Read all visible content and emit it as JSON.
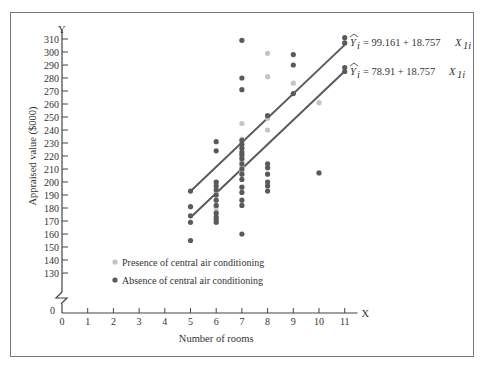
{
  "chart_data": {
    "type": "scatter",
    "title": "",
    "xlabel": "Number of rooms",
    "ylabel": "Appraised value ($000)",
    "x_axis_letter": "X",
    "y_axis_letter": "Y",
    "xlim": [
      0,
      11
    ],
    "ylim": [
      130,
      310
    ],
    "y_axis_break": true,
    "y_origin_label": "0",
    "x_ticks": [
      0,
      1,
      2,
      3,
      4,
      5,
      6,
      7,
      8,
      9,
      10,
      11
    ],
    "y_ticks": [
      130,
      140,
      150,
      160,
      170,
      180,
      190,
      200,
      210,
      220,
      230,
      240,
      250,
      260,
      270,
      280,
      290,
      300,
      310
    ],
    "grid": false,
    "legend_position": "lower-left",
    "series": [
      {
        "name": "Presence of central air conditioning",
        "color": "#c4c4c4",
        "points": [
          [
            6,
            200
          ],
          [
            6,
            192
          ],
          [
            6,
            181
          ],
          [
            6,
            178
          ],
          [
            7,
            245
          ],
          [
            7,
            233
          ],
          [
            7,
            220
          ],
          [
            7,
            216
          ],
          [
            7,
            212
          ],
          [
            7,
            208
          ],
          [
            8,
            299
          ],
          [
            8,
            281
          ],
          [
            8,
            249
          ],
          [
            8,
            240
          ],
          [
            9,
            276
          ],
          [
            10,
            261
          ]
        ]
      },
      {
        "name": "Absence of central air conditioning",
        "color": "#5a5a5a",
        "points": [
          [
            5,
            193
          ],
          [
            5,
            181
          ],
          [
            5,
            174
          ],
          [
            5,
            169
          ],
          [
            5,
            155
          ],
          [
            6,
            231
          ],
          [
            6,
            224
          ],
          [
            6,
            200
          ],
          [
            6,
            197
          ],
          [
            6,
            194
          ],
          [
            6,
            190
          ],
          [
            6,
            186
          ],
          [
            6,
            182
          ],
          [
            6,
            176
          ],
          [
            6,
            173
          ],
          [
            6,
            171
          ],
          [
            6,
            169
          ],
          [
            7,
            309
          ],
          [
            7,
            280
          ],
          [
            7,
            271
          ],
          [
            7,
            232
          ],
          [
            7,
            229
          ],
          [
            7,
            226
          ],
          [
            7,
            223
          ],
          [
            7,
            221
          ],
          [
            7,
            218
          ],
          [
            7,
            214
          ],
          [
            7,
            210
          ],
          [
            7,
            206
          ],
          [
            7,
            202
          ],
          [
            7,
            196
          ],
          [
            7,
            192
          ],
          [
            7,
            186
          ],
          [
            7,
            182
          ],
          [
            7,
            160
          ],
          [
            8,
            251
          ],
          [
            8,
            214
          ],
          [
            8,
            211
          ],
          [
            8,
            206
          ],
          [
            8,
            200
          ],
          [
            8,
            197
          ],
          [
            8,
            193
          ],
          [
            9,
            298
          ],
          [
            9,
            290
          ],
          [
            9,
            268
          ],
          [
            10,
            207
          ],
          [
            11,
            311
          ],
          [
            11,
            307
          ],
          [
            11,
            288
          ],
          [
            11,
            285
          ]
        ]
      }
    ],
    "regression_lines": [
      {
        "label": "Ŷi = 99.161 + 18.757 X1i",
        "intercept": 99.161,
        "slope": 18.757,
        "x_range": [
          5,
          11
        ],
        "color": "#5a5a5a"
      },
      {
        "label": "Ŷi = 78.91 + 18.757 X1i",
        "intercept": 78.91,
        "slope": 18.757,
        "x_range": [
          5,
          11
        ],
        "color": "#5a5a5a"
      }
    ]
  },
  "labels": {
    "eq1_prefix": "= 99.161 + 18.757",
    "eq2_prefix": "= 78.91 + 18.757",
    "eq_y": "Y",
    "eq_y_sub": "i",
    "eq_x": "X",
    "eq_x_sub": "1i"
  }
}
